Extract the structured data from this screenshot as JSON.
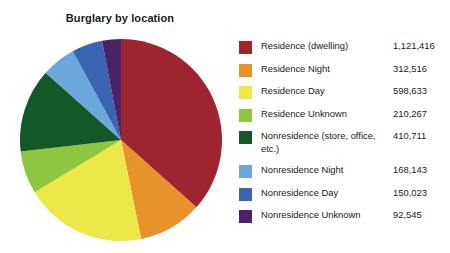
{
  "chart_data": {
    "type": "pie",
    "title": "Burglary by location",
    "xlabel": "",
    "ylabel": "",
    "grid": false,
    "legend_position": "right",
    "start_angle_deg": 0,
    "direction": "clockwise",
    "total": 3064254,
    "categories": [
      "Residence (dwelling)",
      "Residence Night",
      "Residence Day",
      "Residence Unknown",
      "Nonresidence (store, office, etc.)",
      "Nonresidence Night",
      "Nonresidence Day",
      "Nonresidence Unknown"
    ],
    "values": [
      1121416,
      312516,
      598633,
      210267,
      410711,
      168143,
      150023,
      92545
    ],
    "value_labels": [
      "1,121,416",
      "312,516",
      "598,633",
      "210,267",
      "410,711",
      "168,143",
      "150,023",
      "92,545"
    ],
    "colors": [
      "#9E2430",
      "#E8922B",
      "#EDE84A",
      "#8DC63F",
      "#14582A",
      "#6AA8DC",
      "#3A63B0",
      "#4B2468"
    ]
  },
  "legend": {
    "items": [
      {
        "label": "Residence (dwelling)",
        "value": "1,121,416",
        "color": "#9E2430"
      },
      {
        "label": "Residence Night",
        "value": "312,516",
        "color": "#E8922B"
      },
      {
        "label": "Residence Day",
        "value": "598,633",
        "color": "#EDE84A"
      },
      {
        "label": "Residence Unknown",
        "value": "210,267",
        "color": "#8DC63F"
      },
      {
        "label": "Nonresidence (store, office, etc.)",
        "value": "410,711",
        "color": "#14582A"
      },
      {
        "label": "Nonresidence Night",
        "value": "168,143",
        "color": "#6AA8DC"
      },
      {
        "label": "Nonresidence Day",
        "value": "150,023",
        "color": "#3A63B0"
      },
      {
        "label": "Nonresidence Unknown",
        "value": "92,545",
        "color": "#4B2468"
      }
    ]
  }
}
